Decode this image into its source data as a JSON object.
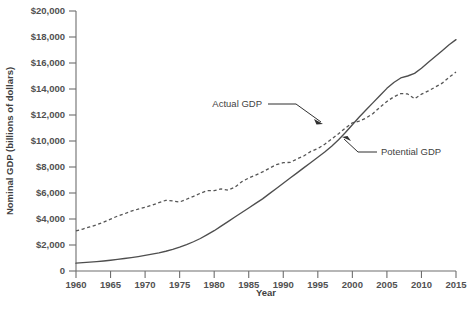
{
  "chart_data": {
    "type": "line",
    "title": "",
    "xlabel": "Year",
    "ylabel": "Nominal GDP (billions of dollars)",
    "xlim": [
      1960,
      2015
    ],
    "ylim": [
      0,
      20000
    ],
    "grid": false,
    "legend_position": "inline-annotations",
    "xticks": [
      1960,
      1965,
      1970,
      1975,
      1980,
      1985,
      1990,
      1995,
      2000,
      2005,
      2010,
      2015
    ],
    "xtick_labels": [
      "1960",
      "1965",
      "1970",
      "1975",
      "1980",
      "1985",
      "1990",
      "1995",
      "2000",
      "2005",
      "2010",
      "2015"
    ],
    "yticks": [
      0,
      2000,
      4000,
      6000,
      8000,
      10000,
      12000,
      14000,
      16000,
      18000,
      20000
    ],
    "ytick_labels": [
      "0",
      "$2,000",
      "$4,000",
      "$6,000",
      "$8,000",
      "$10,000",
      "$12,000",
      "$14,000",
      "$16,000",
      "$18,000",
      "$20,000"
    ],
    "annotations": [
      {
        "text": "Actual GDP",
        "series": "Actual GDP",
        "points_to_year": 1999
      },
      {
        "text": "Potential GDP",
        "series": "Potential GDP",
        "points_to_year": 2002
      }
    ],
    "series": [
      {
        "name": "Actual GDP",
        "style": "dashed",
        "color": "#555555",
        "x": [
          1960,
          1961,
          1962,
          1963,
          1964,
          1965,
          1966,
          1967,
          1968,
          1969,
          1970,
          1971,
          1972,
          1973,
          1974,
          1975,
          1976,
          1977,
          1978,
          1979,
          1980,
          1981,
          1982,
          1983,
          1984,
          1985,
          1986,
          1987,
          1988,
          1989,
          1990,
          1991,
          1992,
          1993,
          1994,
          1995,
          1996,
          1997,
          1998,
          1999,
          2000,
          2001,
          2002,
          2003,
          2004,
          2005,
          2006,
          2007,
          2008,
          2009,
          2010,
          2011,
          2012,
          2013,
          2014,
          2015
        ],
        "values": [
          3080,
          3230,
          3390,
          3560,
          3760,
          3990,
          4220,
          4400,
          4600,
          4760,
          4900,
          5060,
          5260,
          5440,
          5390,
          5310,
          5520,
          5740,
          5980,
          6180,
          6180,
          6320,
          6220,
          6450,
          6870,
          7150,
          7380,
          7620,
          7910,
          8180,
          8340,
          8350,
          8620,
          8860,
          9200,
          9420,
          9750,
          10150,
          10560,
          11000,
          11400,
          11530,
          11770,
          12120,
          12600,
          13040,
          13400,
          13650,
          13620,
          13250,
          13600,
          13850,
          14150,
          14450,
          14900,
          15300
        ],
        "note": "Dashed line; dips in 1974-75, flattens 1980-82, plateaus 1990-91, declines 2008-2009, recovers thereafter"
      },
      {
        "name": "Potential GDP",
        "style": "solid",
        "color": "#4e4e4e",
        "x": [
          1960,
          1961,
          1962,
          1963,
          1964,
          1965,
          1966,
          1967,
          1968,
          1969,
          1970,
          1971,
          1972,
          1973,
          1974,
          1975,
          1976,
          1977,
          1978,
          1979,
          1980,
          1981,
          1982,
          1983,
          1984,
          1985,
          1986,
          1987,
          1988,
          1989,
          1990,
          1991,
          1992,
          1993,
          1994,
          1995,
          1996,
          1997,
          1998,
          1999,
          2000,
          2001,
          2002,
          2003,
          2004,
          2005,
          2006,
          2007,
          2008,
          2009,
          2010,
          2011,
          2012,
          2013,
          2014,
          2015
        ],
        "values": [
          600,
          640,
          680,
          720,
          770,
          830,
          890,
          960,
          1030,
          1110,
          1200,
          1300,
          1400,
          1520,
          1660,
          1830,
          2030,
          2250,
          2500,
          2800,
          3100,
          3450,
          3800,
          4150,
          4500,
          4850,
          5200,
          5550,
          5950,
          6350,
          6750,
          7150,
          7550,
          7950,
          8350,
          8750,
          9150,
          9600,
          10100,
          10650,
          11250,
          11850,
          12400,
          12950,
          13500,
          14050,
          14500,
          14850,
          15000,
          15200,
          15600,
          16050,
          16500,
          16950,
          17400,
          17800
        ],
        "note": "Solid line; smooth accelerating growth, crosses above Actual GDP near 2008"
      }
    ]
  }
}
